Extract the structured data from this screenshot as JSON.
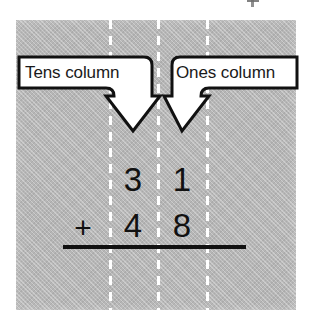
{
  "diagram": {
    "panel": {
      "background_color": "#b6b6b6",
      "divider_color": "#ffffff"
    },
    "callouts": [
      {
        "id": "tens",
        "label": "Tens column",
        "points_to": "tens-column",
        "box_color": "#ffffff",
        "outline_color": "#111111"
      },
      {
        "id": "ones",
        "label": "Ones column",
        "points_to": "ones-column",
        "box_color": "#ffffff",
        "outline_color": "#111111"
      }
    ],
    "columns": [
      {
        "name": "tens-column"
      },
      {
        "name": "ones-column"
      }
    ],
    "sum": {
      "operator": "+",
      "addend_one": {
        "tens": "3",
        "ones": "1",
        "value": "31"
      },
      "addend_two": {
        "tens": "4",
        "ones": "8",
        "value": "48"
      },
      "rule_color": "#111111"
    },
    "icons": {
      "left_arrow": "down-arrow-icon",
      "right_arrow": "down-arrow-icon"
    }
  }
}
